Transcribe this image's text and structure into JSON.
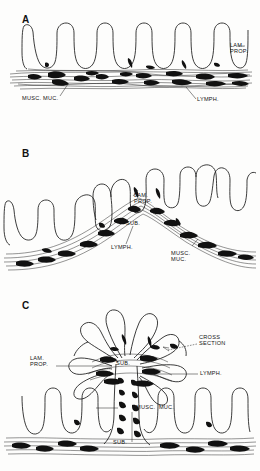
{
  "figure": {
    "type": "anatomical-line-diagram",
    "background_color": "#fdfdfc",
    "ink_color": "#1a1a1a"
  },
  "panels": [
    {
      "letter": "A",
      "labels": [
        {
          "key": "lam_prop",
          "text": "LAM.\nPROP."
        },
        {
          "key": "musc_muc",
          "text": "MUSC. MUC."
        },
        {
          "key": "lymph",
          "text": "LYMPH."
        }
      ]
    },
    {
      "letter": "B",
      "labels": [
        {
          "key": "lam_prop",
          "text": "LAM.\nPROP."
        },
        {
          "key": "sub",
          "text": "SUB."
        },
        {
          "key": "lymph",
          "text": "LYMPH."
        },
        {
          "key": "musc_muc",
          "text": "MUSC.\nMUC."
        }
      ]
    },
    {
      "letter": "C",
      "labels": [
        {
          "key": "cross_section",
          "text": "CROSS\nSECTION"
        },
        {
          "key": "lam_prop",
          "text": "LAM.\nPROP."
        },
        {
          "key": "sub_upper",
          "text": "SUB."
        },
        {
          "key": "lymph",
          "text": "LYMPH."
        },
        {
          "key": "musc_muc",
          "text": "MUSC.  MUC."
        },
        {
          "key": "sub_lower",
          "text": "SUB."
        }
      ]
    }
  ]
}
